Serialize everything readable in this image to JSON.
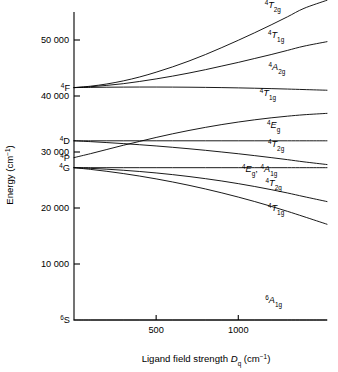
{
  "figure": {
    "kind": "energy-level-correlation-diagram",
    "background": "#ffffff",
    "ink": "#000000"
  },
  "axes": {
    "y_title_main": "Energy (cm",
    "y_title_sup": "−1",
    "y_title_tail": ")",
    "x_title_lead": "Ligand field strength ",
    "x_title_symbol": "D",
    "x_title_symbol_sub": "q",
    "x_title_unit_open": " (cm",
    "x_title_unit_sup": "−1",
    "x_title_unit_close": ")",
    "y_ticks": [
      {
        "label": "50 000",
        "value": 50000
      },
      {
        "label": "40 000",
        "value": 40000
      },
      {
        "label": "30 000",
        "value": 30000
      },
      {
        "label": "20 000",
        "value": 20000
      },
      {
        "label": "10 000",
        "value": 10000
      }
    ],
    "x_ticks": [
      {
        "label": "500",
        "value": 500
      },
      {
        "label": "1000",
        "value": 1000
      }
    ],
    "free_ion_labels": [
      {
        "sup": "4",
        "term": "F",
        "value": 41500
      },
      {
        "sup": "4",
        "term": "D",
        "value": 32000
      },
      {
        "sup": "4",
        "term": "P",
        "value": 29000
      },
      {
        "sup": "4",
        "term": "G",
        "value": 27200
      },
      {
        "sup": "6",
        "term": "S",
        "value": 0
      }
    ]
  },
  "chart_data": {
    "type": "line",
    "title": "",
    "xlabel": "Ligand field strength Dq (cm−1)",
    "ylabel": "Energy (cm−1)",
    "xlim": [
      0,
      1540
    ],
    "ylim": [
      0,
      55000
    ],
    "grid": false,
    "legend": "right-inline-labels",
    "x": [
      0,
      100,
      200,
      300,
      400,
      500,
      600,
      700,
      800,
      900,
      1000,
      1100,
      1200,
      1300,
      1400,
      1540
    ],
    "series": [
      {
        "name": "4T2g (from 4F)",
        "label_sup": "4",
        "label_term": "T",
        "label_sub": "2g",
        "origin": "4F",
        "values": [
          41500,
          41750,
          42150,
          42700,
          43400,
          44250,
          45200,
          46250,
          47400,
          48650,
          49950,
          51300,
          52700,
          54150,
          55650,
          57100
        ],
        "label_x": 1210,
        "label_y": 55700
      },
      {
        "name": "4T1g (from 4F)",
        "label_sup": "4",
        "label_term": "T",
        "label_sub": "1g",
        "origin": "4F",
        "values": [
          41500,
          41650,
          41900,
          42200,
          42600,
          43050,
          43550,
          44100,
          44700,
          45350,
          46000,
          46700,
          47400,
          48150,
          48900,
          49700
        ],
        "label_x": 1230,
        "label_y": 50350
      },
      {
        "name": "4A2g (from 4F)",
        "label_sup": "4",
        "label_term": "A",
        "label_sub": "2g",
        "origin": "4F",
        "values": [
          41500,
          41540,
          41570,
          41590,
          41600,
          41600,
          41590,
          41570,
          41540,
          41500,
          41450,
          41390,
          41320,
          41240,
          41150,
          41030
        ],
        "label_x": 1235,
        "label_y": 44650
      },
      {
        "name": "4T1g (from 4P)",
        "label_sup": "4",
        "label_term": "T",
        "label_sub": "1g",
        "origin": "4P",
        "values": [
          29000,
          29700,
          30450,
          31200,
          31900,
          32600,
          33250,
          33850,
          34400,
          34900,
          35350,
          35750,
          36100,
          36400,
          36650,
          36900
        ],
        "label_x": 1180,
        "label_y": 40050
      },
      {
        "name": "4Eg (from 4D)",
        "label_sup": "4",
        "label_term": "E",
        "label_sub": "g",
        "origin": "4D",
        "values": [
          32000,
          32000,
          32000,
          32000,
          32000,
          32000,
          32000,
          32000,
          32000,
          32000,
          32000,
          32000,
          32000,
          32000,
          32000,
          32000
        ],
        "label_x": 1215,
        "label_y": 34350
      },
      {
        "name": "4T2g (from 4D)",
        "label_sup": "4",
        "label_term": "T",
        "label_sub": "2g",
        "origin": "4D",
        "values": [
          32000,
          31850,
          31680,
          31500,
          31300,
          31080,
          30840,
          30580,
          30300,
          30000,
          29690,
          29350,
          29000,
          28630,
          28240,
          27760
        ],
        "label_x": 1230,
        "label_y": 30950
      },
      {
        "name": "4Eg, 4A1g (from 4G)",
        "label_sup": "4",
        "label_term": "E",
        "label_sub": "g",
        "label_sup2": "4",
        "label_term2": "A",
        "label_sub2": "1g",
        "origin": "4G",
        "values": [
          27200,
          27200,
          27200,
          27200,
          27200,
          27200,
          27200,
          27200,
          27200,
          27200,
          27200,
          27200,
          27200,
          27200,
          27200,
          27200
        ],
        "label_x": 1130,
        "label_y": 26350
      },
      {
        "name": "4T2g (from 4G)",
        "label_sup": "4",
        "label_term": "T",
        "label_sub": "2g",
        "origin": "4G",
        "values": [
          27200,
          27080,
          26930,
          26740,
          26520,
          26260,
          25960,
          25620,
          25240,
          24820,
          24350,
          23840,
          23280,
          22680,
          22030,
          21150
        ],
        "label_x": 1215,
        "label_y": 23900
      },
      {
        "name": "4T1g (from 4G)",
        "label_sup": "4",
        "label_term": "T",
        "label_sub": "1g",
        "origin": "4G",
        "values": [
          27200,
          26900,
          26550,
          26150,
          25700,
          25200,
          24650,
          24050,
          23400,
          22700,
          21950,
          21150,
          20300,
          19400,
          18450,
          17100
        ],
        "label_x": 1230,
        "label_y": 19400
      },
      {
        "name": "6A1g (from 6S)",
        "label_sup": "6",
        "label_term": "A",
        "label_sub": "1g",
        "origin": "6S",
        "values": [
          0,
          0,
          0,
          0,
          0,
          0,
          0,
          0,
          0,
          0,
          0,
          0,
          0,
          0,
          0,
          0
        ],
        "label_x": 1215,
        "label_y": 3100
      }
    ]
  }
}
